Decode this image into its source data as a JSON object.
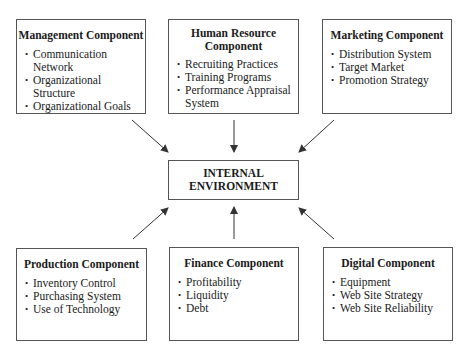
{
  "center": {
    "line1": "INTERNAL",
    "line2": "ENVIRONMENT"
  },
  "components": {
    "management": {
      "title": "Management Component",
      "items": [
        "Communication Network",
        "Organizational Structure",
        "Organizational Goals"
      ]
    },
    "human_resource": {
      "title_line1": "Human Resource",
      "title_line2": "Component",
      "items": [
        "Recruiting Practices",
        "Training Programs",
        "Performance Appraisal System"
      ]
    },
    "marketing": {
      "title": "Marketing Component",
      "items": [
        "Distribution System",
        "Target Market",
        "Promotion Strategy"
      ]
    },
    "production": {
      "title": "Production Component",
      "items": [
        "Inventory Control",
        "Purchasing System",
        "Use of Technology"
      ]
    },
    "finance": {
      "title": "Finance Component",
      "items": [
        "Profitability",
        "Liquidity",
        "Debt"
      ]
    },
    "digital": {
      "title": "Digital Component",
      "items": [
        "Equipment",
        "Web Site Strategy",
        "Web Site Reliability"
      ]
    }
  },
  "colors": {
    "border": "#555555",
    "arrow": "#333333",
    "background": "#ffffff"
  }
}
